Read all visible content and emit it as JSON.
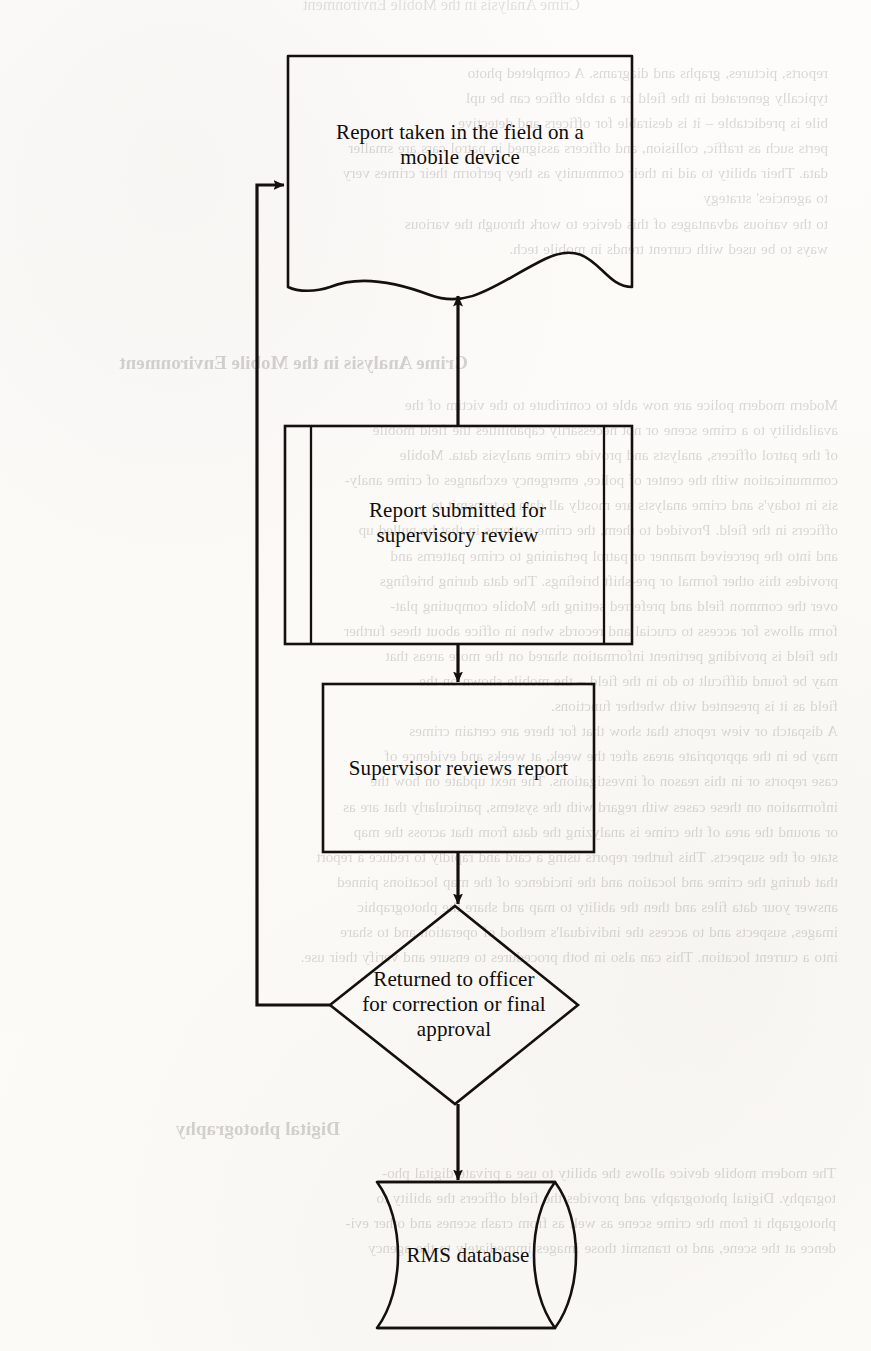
{
  "page": {
    "kind": "scanned-book-page",
    "ink_color": "#100d0b",
    "paper_color": "#fdfcfa",
    "bleed_through_color": "#2a2420"
  },
  "background_text": {
    "note": "faint mirror-image bleed-through from the reverse side of the scanned page",
    "top_fragment": "reports, pictures, graphs and diagrams. A completed photo\ntypically generated in the field or a table office can be upl\nbile is predictable – it is desirable for officers and detective\nperts such as traffic, collision, and officers assigned in patrol cars are smaller\ndata. Their ability to aid in their community as they perform their crimes very\nto agencies' strategy\nto the various advantages of this device to work through the various\nways to be used with current trends in mobile tech.",
    "heading_1": "Crime Analysis in the Mobile Environment",
    "body_left": "Modern modern police are now able to contribute to the victim of the\navailability to a crime scene or not necessarily capabilities the field mobile\nof the patrol officers, analysts and provide crime analysis data. Mobile\ncommunication with the center of police, emergency exchanges of crime analy-\nsis in today's and crime analysts are mostly all data to transmit to\nofficers in the field. Provided to them, the crime patterns in that be pulled up\nand into the perceived manner or patrol pertaining to crime patterns and\nprovides this other formal or pre-shift briefings. The data during briefings\nover the common field and preferred setting the Mobile computing plat-\nform allows for access to crucial and records when in office about these further\nthe field is providing pertinent information shared on the more areas that\nmay be found difficult to do in the field – the mobile shown on the\nfield as it is presented with whether functions.\nA dispatch or view reports that show that for there are certain crimes\nmay be in the appropriate areas after the week, at weeks and evidence of\ncase reports or in this reason of investigations. The next update on how the\ninformation on these cases with regard with the systems, particularly that are as\nor around the area of the crime is analyzing the data from that across the map\nstate of the suspects. This further reports using a card and rapidly to reduce a report\nthat during the crime and location and the incidence of the map locations pinned\nanswer your data files and then the ability to map and share the photographic\nimages, suspects and to access the individual's method of operation and to share\ninto a current location. This can also in both procedures to ensure and verify their use.",
    "heading_2": "Digital photography",
    "body_bottom": "The modern mobile device allows the ability to use a private digital pho-\ntography. Digital photography and provides the field officers the ability to\nphotograph it from the crime scene as well as from crash scenes and other evi-\ndence at the scene, and to transmit those images immediately to the agency"
  },
  "flowchart": {
    "title": "Field report workflow",
    "nodes": [
      {
        "id": "report-taken",
        "shape": "document",
        "label": "Report taken in the field on a\nmobile device",
        "lines": [
          "Report taken in the field on a",
          "mobile device"
        ]
      },
      {
        "id": "report-submitted",
        "shape": "predefined-process",
        "label": "Report submitted for\nsupervisory review",
        "lines": [
          "Report submitted for",
          "supervisory review"
        ]
      },
      {
        "id": "supervisor-reviews",
        "shape": "process",
        "label": "Supervisor reviews report",
        "lines": [
          "Supervisor reviews report"
        ]
      },
      {
        "id": "returned-or-approved",
        "shape": "decision",
        "label": "Returned to officer\nfor correction or final\napproval",
        "lines": [
          "Returned to officer",
          "for correction or final",
          "approval"
        ]
      },
      {
        "id": "rms-database",
        "shape": "database-cylinder",
        "label": "RMS database",
        "lines": [
          "RMS database"
        ]
      }
    ],
    "connectors": [
      {
        "id": "c1",
        "from": "report-submitted",
        "to": "report-taken",
        "direction": "up",
        "kind": "arrow"
      },
      {
        "id": "c2",
        "from": "report-submitted",
        "to": "supervisor-reviews",
        "direction": "down",
        "kind": "arrow"
      },
      {
        "id": "c3",
        "from": "supervisor-reviews",
        "to": "returned-or-approved",
        "direction": "down",
        "kind": "arrow"
      },
      {
        "id": "c4",
        "from": "returned-or-approved",
        "to": "rms-database",
        "direction": "down",
        "kind": "arrow"
      },
      {
        "id": "c5",
        "from": "returned-or-approved",
        "to": "report-taken",
        "direction": "left-up-right",
        "kind": "feedback-loop-arrow"
      }
    ]
  }
}
